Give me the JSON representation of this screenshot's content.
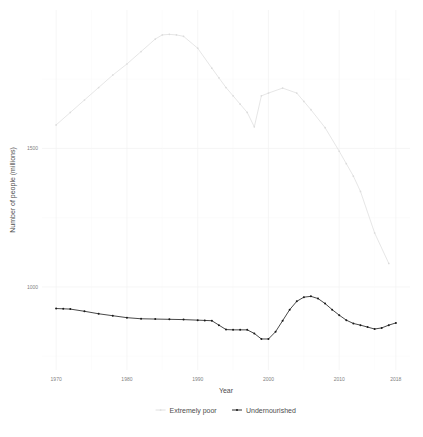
{
  "chart_data": {
    "type": "line",
    "title": "",
    "xlabel": "Year",
    "ylabel": "Number of people (millions)",
    "xlim": [
      1968,
      2020
    ],
    "ylim": [
      700,
      2000
    ],
    "xticks": [
      1970,
      1980,
      1990,
      2000,
      2010,
      2018
    ],
    "xtick_labels": [
      "1970",
      "1980",
      "1990",
      "2000",
      "2010",
      "2018"
    ],
    "yticks": [
      1000,
      1500
    ],
    "ytick_labels": [
      "1000",
      "1500"
    ],
    "grid": true,
    "legend_position": "bottom",
    "series": [
      {
        "name": "Extremely poor",
        "color": "#e3e3e3",
        "x": [
          1970,
          1972,
          1974,
          1976,
          1978,
          1980,
          1982,
          1984,
          1985,
          1986,
          1987,
          1988,
          1990,
          1992,
          1993,
          1994,
          1995,
          1996,
          1997,
          1998,
          1999,
          2000,
          2002,
          2004,
          2005,
          2006,
          2008,
          2010,
          2011,
          2012,
          2013,
          2015,
          2017
        ],
        "y": [
          1585,
          1630,
          1675,
          1720,
          1765,
          1805,
          1850,
          1895,
          1910,
          1912,
          1910,
          1905,
          1862,
          1790,
          1755,
          1720,
          1690,
          1660,
          1630,
          1578,
          1690,
          1700,
          1718,
          1700,
          1670,
          1640,
          1575,
          1490,
          1445,
          1400,
          1345,
          1195,
          1085
        ],
        "style": "line-with-points"
      },
      {
        "name": "Undernourished",
        "color": "#1a1a1a",
        "x": [
          1970,
          1971,
          1972,
          1974,
          1976,
          1978,
          1980,
          1982,
          1984,
          1986,
          1988,
          1990,
          1991,
          1992,
          1993,
          1994,
          1995,
          1996,
          1997,
          1998,
          1999,
          2000,
          2001,
          2002,
          2003,
          2004,
          2005,
          2006,
          2007,
          2008,
          2009,
          2010,
          2011,
          2012,
          2013,
          2014,
          2015,
          2016,
          2017,
          2018
        ],
        "y": [
          922,
          921,
          920,
          912,
          903,
          896,
          889,
          885,
          884,
          883,
          882,
          880,
          879,
          878,
          862,
          846,
          845,
          845,
          845,
          832,
          812,
          812,
          838,
          878,
          918,
          948,
          963,
          966,
          958,
          940,
          918,
          898,
          880,
          868,
          862,
          855,
          848,
          852,
          862,
          870
        ],
        "style": "line-with-points"
      }
    ]
  },
  "legend": {
    "items": [
      {
        "label": "Extremely poor",
        "color": "#dcdcdc"
      },
      {
        "label": "Undernourished",
        "color": "#1a1a1a"
      }
    ]
  }
}
